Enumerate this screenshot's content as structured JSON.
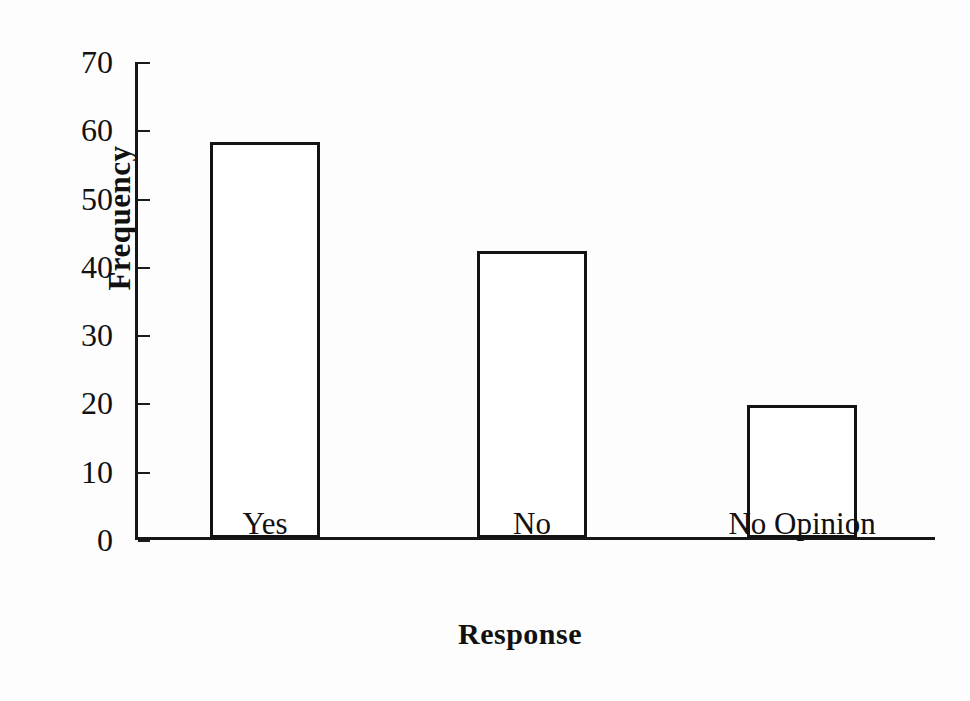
{
  "chart_data": {
    "type": "bar",
    "title": "",
    "xlabel": "Response",
    "ylabel": "Frequency",
    "categories": [
      "Yes",
      "No",
      "No Opinion"
    ],
    "values": [
      58,
      42,
      19.5
    ],
    "ylim": [
      0,
      70
    ],
    "yticks": [
      0,
      10,
      20,
      30,
      40,
      50,
      60,
      70
    ],
    "ytick_labels": [
      "0",
      "10",
      "20",
      "30",
      "40",
      "50",
      "60",
      "70"
    ],
    "grid": false,
    "legend": null,
    "bar_fill_color": "#ffffff",
    "bar_edge_color": "#131313",
    "axis_color": "#161616",
    "background_color": "#ffffff"
  },
  "axes": {
    "y_title": "Frequency",
    "x_title": "Response"
  }
}
